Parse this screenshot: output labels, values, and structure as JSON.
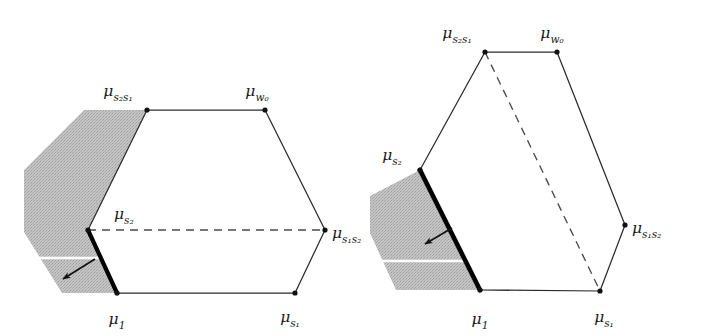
{
  "figure": {
    "name": "moment-polytope-diagram-pair",
    "background_color": "#ffffff",
    "stroke_color": "#2b2b2b",
    "thick_edge_color": "#000000",
    "shade_color": "#bdbdbd",
    "dash_color": "#4a4a4a"
  },
  "panels": [
    {
      "id": "left",
      "name": "left-polytope",
      "polygon": [
        {
          "key": "mu_s2s1",
          "x": 147,
          "y": 110
        },
        {
          "key": "mu_w0",
          "x": 265,
          "y": 110
        },
        {
          "key": "mu_s1s2",
          "x": 325,
          "y": 230
        },
        {
          "key": "mu_s1",
          "x": 295,
          "y": 293
        },
        {
          "key": "mu_1",
          "x": 117,
          "y": 293
        },
        {
          "key": "mu_s2",
          "x": 88,
          "y": 230
        }
      ],
      "thick_edge": {
        "from": "mu_s2",
        "to": "mu_1"
      },
      "dashed_edge": {
        "from": "mu_s2",
        "to": "mu_s1s2"
      },
      "shaded_region": [
        {
          "x": 88,
          "y": 230
        },
        {
          "x": 147,
          "y": 110
        },
        {
          "x": 84,
          "y": 110
        },
        {
          "x": 24,
          "y": 170
        },
        {
          "x": 24,
          "y": 232
        },
        {
          "x": 62,
          "y": 293
        },
        {
          "x": 117,
          "y": 293
        }
      ],
      "white_gap_line": {
        "x1": 24,
        "y1": 258,
        "x2": 105,
        "y2": 258
      },
      "arrow": {
        "x1": 95,
        "y1": 259,
        "x2": 63,
        "y2": 279
      },
      "labels": [
        {
          "key": "mu_s2s1",
          "base": "μ",
          "sub": "s₂s₁",
          "x": 118,
          "y": 96,
          "anchor": "middle"
        },
        {
          "key": "mu_w0",
          "base": "μ",
          "sub": "w₀",
          "x": 257,
          "y": 96,
          "anchor": "middle"
        },
        {
          "key": "mu_s1s2",
          "base": "μ",
          "sub": "s₁s₂",
          "x": 332,
          "y": 238,
          "anchor": "start"
        },
        {
          "key": "mu_s1",
          "base": "μ",
          "sub": "s₁",
          "x": 290,
          "y": 322,
          "anchor": "middle"
        },
        {
          "key": "mu_1",
          "base": "μ",
          "sub": "1",
          "x": 117,
          "y": 324,
          "anchor": "middle"
        },
        {
          "key": "mu_s2",
          "base": "μ",
          "sub": "s₂",
          "x": 114,
          "y": 219,
          "anchor": "start"
        }
      ]
    },
    {
      "id": "right",
      "name": "right-polytope",
      "polygon": [
        {
          "key": "mu_s2s1",
          "x": 485,
          "y": 52
        },
        {
          "key": "mu_w0",
          "x": 557,
          "y": 52
        },
        {
          "key": "mu_s1s2",
          "x": 625,
          "y": 225
        },
        {
          "key": "mu_s1",
          "x": 600,
          "y": 291
        },
        {
          "key": "mu_1",
          "x": 480,
          "y": 290
        },
        {
          "key": "mu_s2",
          "x": 420,
          "y": 170
        }
      ],
      "thick_edge": {
        "from": "mu_s2",
        "to": "mu_1"
      },
      "dashed_edge": {
        "from": "mu_s2s1",
        "to": "mu_s1"
      },
      "shaded_region": [
        {
          "x": 420,
          "y": 170
        },
        {
          "x": 480,
          "y": 290
        },
        {
          "x": 396,
          "y": 290
        },
        {
          "x": 370,
          "y": 233
        },
        {
          "x": 370,
          "y": 196
        }
      ],
      "white_gap_line": {
        "x1": 370,
        "y1": 261,
        "x2": 464,
        "y2": 261
      },
      "arrow": {
        "x1": 452,
        "y1": 228,
        "x2": 425,
        "y2": 244
      },
      "labels": [
        {
          "key": "mu_s2s1",
          "base": "μ",
          "sub": "s₂s₁",
          "x": 457,
          "y": 38,
          "anchor": "middle"
        },
        {
          "key": "mu_w0",
          "base": "μ",
          "sub": "w₀",
          "x": 552,
          "y": 38,
          "anchor": "middle"
        },
        {
          "key": "mu_s1s2",
          "base": "μ",
          "sub": "s₁s₂",
          "x": 632,
          "y": 233,
          "anchor": "start"
        },
        {
          "key": "mu_s1",
          "base": "μ",
          "sub": "s₁",
          "x": 604,
          "y": 322,
          "anchor": "middle"
        },
        {
          "key": "mu_1",
          "base": "μ",
          "sub": "1",
          "x": 480,
          "y": 324,
          "anchor": "middle"
        },
        {
          "key": "mu_s2",
          "base": "μ",
          "sub": "s₂",
          "x": 392,
          "y": 160,
          "anchor": "middle"
        }
      ]
    }
  ]
}
